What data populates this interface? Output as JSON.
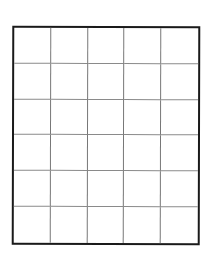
{
  "grid": {
    "rows": 6,
    "columns": 5,
    "border_color": "#1a1a1a",
    "line_color": "#777777",
    "background": "#ffffff"
  }
}
